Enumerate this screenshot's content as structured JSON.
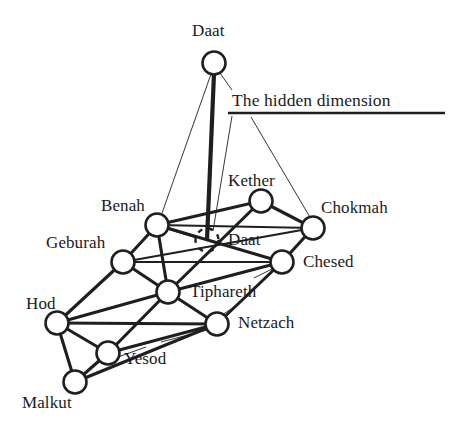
{
  "diagram": {
    "caption": {
      "text": "The hidden dimension",
      "x": 232,
      "y": 92,
      "underline": {
        "x1": 228,
        "y1": 113,
        "x2": 445,
        "y2": 113
      }
    },
    "colors": {
      "ink": "#1f1f1f",
      "paper": "#ffffff",
      "label": "#1a1a1a"
    },
    "nodes": [
      {
        "id": "daat_top",
        "label": "Daat",
        "cx": 214,
        "cy": 63,
        "r": 11.5,
        "style": "solid",
        "label_x": 192,
        "label_y": 22
      },
      {
        "id": "kether",
        "label": "Kether",
        "cx": 261,
        "cy": 201,
        "r": 11.5,
        "style": "solid",
        "label_x": 228,
        "label_y": 172
      },
      {
        "id": "chokmah",
        "label": "Chokmah",
        "cx": 313,
        "cy": 228,
        "r": 11.5,
        "style": "solid",
        "label_x": 321,
        "label_y": 199
      },
      {
        "id": "benah",
        "label": "Benah",
        "cx": 157,
        "cy": 225,
        "r": 11.5,
        "style": "solid",
        "label_x": 101,
        "label_y": 197
      },
      {
        "id": "daat_hidden",
        "label": "Daat",
        "cx": 207,
        "cy": 240,
        "r": 11.5,
        "style": "dashed",
        "label_x": 228,
        "label_y": 231
      },
      {
        "id": "geburah",
        "label": "Geburah",
        "cx": 123,
        "cy": 262,
        "r": 11.5,
        "style": "solid",
        "label_x": 46,
        "label_y": 234
      },
      {
        "id": "chesed",
        "label": "Chesed",
        "cx": 282,
        "cy": 262,
        "r": 11.5,
        "style": "solid",
        "label_x": 303,
        "label_y": 253
      },
      {
        "id": "tiphareth",
        "label": "Tiphareth",
        "cx": 168,
        "cy": 292,
        "r": 11.5,
        "style": "solid",
        "label_x": 190,
        "label_y": 283
      },
      {
        "id": "hod",
        "label": "Hod",
        "cx": 57,
        "cy": 323,
        "r": 11.5,
        "style": "solid",
        "label_x": 26,
        "label_y": 295
      },
      {
        "id": "netzach",
        "label": "Netzach",
        "cx": 217,
        "cy": 324,
        "r": 11.5,
        "style": "solid",
        "label_x": 238,
        "label_y": 314
      },
      {
        "id": "yesod",
        "label": "Yesod",
        "cx": 108,
        "cy": 353,
        "r": 11.5,
        "style": "solid",
        "label_x": 124,
        "label_y": 350
      },
      {
        "id": "malkut",
        "label": "Malkut",
        "cx": 75,
        "cy": 382,
        "r": 11.5,
        "style": "solid",
        "label_x": 22,
        "label_y": 394
      }
    ],
    "edges": [
      {
        "from": "kether",
        "to": "benah",
        "weight": "thick"
      },
      {
        "from": "kether",
        "to": "chokmah",
        "weight": "thick"
      },
      {
        "from": "kether",
        "to": "tiphareth",
        "weight": "thick"
      },
      {
        "from": "benah",
        "to": "chokmah",
        "weight": "medium"
      },
      {
        "from": "benah",
        "to": "geburah",
        "weight": "thick"
      },
      {
        "from": "benah",
        "to": "tiphareth",
        "weight": "thick"
      },
      {
        "from": "benah",
        "to": "chesed",
        "weight": "thick"
      },
      {
        "from": "chokmah",
        "to": "chesed",
        "weight": "thick"
      },
      {
        "from": "chokmah",
        "to": "geburah",
        "weight": "medium"
      },
      {
        "from": "geburah",
        "to": "chesed",
        "weight": "medium"
      },
      {
        "from": "geburah",
        "to": "tiphareth",
        "weight": "thick"
      },
      {
        "from": "geburah",
        "to": "hod",
        "weight": "thick"
      },
      {
        "from": "chesed",
        "to": "tiphareth",
        "weight": "thick"
      },
      {
        "from": "chesed",
        "to": "netzach",
        "weight": "thick"
      },
      {
        "from": "tiphareth",
        "to": "hod",
        "weight": "thick"
      },
      {
        "from": "tiphareth",
        "to": "netzach",
        "weight": "thick"
      },
      {
        "from": "tiphareth",
        "to": "yesod",
        "weight": "thick"
      },
      {
        "from": "hod",
        "to": "netzach",
        "weight": "thick"
      },
      {
        "from": "hod",
        "to": "yesod",
        "weight": "thick"
      },
      {
        "from": "hod",
        "to": "malkut",
        "weight": "thick"
      },
      {
        "from": "netzach",
        "to": "yesod",
        "weight": "thick"
      },
      {
        "from": "netzach",
        "to": "malkut",
        "weight": "thick"
      },
      {
        "from": "yesod",
        "to": "malkut",
        "weight": "thick"
      }
    ],
    "pillar": {
      "from": "daat_top",
      "to": "daat_hidden",
      "weight": "pillar"
    },
    "leaders": [
      {
        "name": "daat-top-to-benah",
        "x1": 211,
        "y1": 74,
        "x2": 161,
        "y2": 216
      },
      {
        "name": "daat-top-to-caption",
        "x1": 220,
        "y1": 73,
        "x2": 232,
        "y2": 90
      },
      {
        "name": "caption-to-daat-hidden",
        "x1": 232,
        "y1": 116,
        "x2": 213,
        "y2": 231
      },
      {
        "name": "caption-to-chokmah",
        "x1": 251,
        "y1": 117,
        "x2": 311,
        "y2": 219
      },
      {
        "name": "daat-hidden-to-benah",
        "x1": 196,
        "y1": 238,
        "x2": 167,
        "y2": 229
      },
      {
        "name": "chesed-tick-upper",
        "x1": 272,
        "y1": 265,
        "x2": 232,
        "y2": 276
      },
      {
        "name": "chesed-tick-lower",
        "x1": 274,
        "y1": 268,
        "x2": 254,
        "y2": 278
      },
      {
        "name": "tiphareth-tick",
        "x1": 179,
        "y1": 289,
        "x2": 190,
        "y2": 287
      },
      {
        "name": "netzach-tick-upper",
        "x1": 222,
        "y1": 315,
        "x2": 237,
        "y2": 305
      },
      {
        "name": "netzach-tick-lower",
        "x1": 207,
        "y1": 330,
        "x2": 161,
        "y2": 342
      },
      {
        "name": "yesod-tick",
        "x1": 118,
        "y1": 357,
        "x2": 146,
        "y2": 347
      }
    ]
  }
}
